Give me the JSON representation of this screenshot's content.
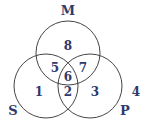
{
  "diagram": {
    "type": "venn",
    "sets": [
      {
        "name": "M",
        "cx": 68,
        "cy": 53,
        "r": 32,
        "label_x": 68,
        "label_y": 15
      },
      {
        "name": "S",
        "cx": 46,
        "cy": 86,
        "r": 32,
        "label_x": 13,
        "label_y": 115
      },
      {
        "name": "P",
        "cx": 90,
        "cy": 86,
        "r": 32,
        "label_x": 125,
        "label_y": 115
      }
    ],
    "regions": [
      {
        "id": "1",
        "label": "1",
        "x": 39,
        "y": 96
      },
      {
        "id": "2",
        "label": "2",
        "x": 68,
        "y": 96
      },
      {
        "id": "3",
        "label": "3",
        "x": 95,
        "y": 96
      },
      {
        "id": "4",
        "label": "4",
        "x": 136,
        "y": 96
      },
      {
        "id": "5",
        "label": "5",
        "x": 55,
        "y": 72
      },
      {
        "id": "6",
        "label": "6",
        "x": 68,
        "y": 81
      },
      {
        "id": "7",
        "label": "7",
        "x": 83,
        "y": 72
      },
      {
        "id": "8",
        "label": "8",
        "x": 68,
        "y": 50
      }
    ],
    "colors": {
      "stroke": "#444444",
      "text": "#2f3a6b"
    }
  }
}
